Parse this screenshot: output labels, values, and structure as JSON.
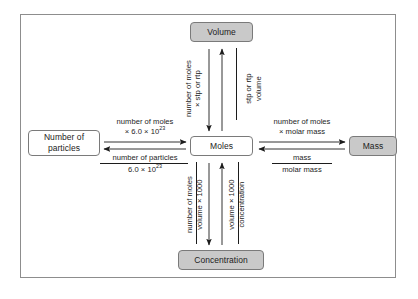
{
  "diagram": {
    "colors": {
      "box_grey": "#c9c9c9",
      "box_white": "#ffffff",
      "border": "#7a7a7a",
      "frame": "#8d8d8d",
      "text": "#1c1c1c",
      "arrow": "#1c1c1c"
    },
    "nodes": [
      {
        "id": "volume",
        "label": "Volume",
        "fill": "grey"
      },
      {
        "id": "moles",
        "label": "Moles",
        "fill": "white"
      },
      {
        "id": "concentration",
        "label": "Concentration",
        "fill": "grey"
      },
      {
        "id": "particles",
        "label": "Number of\nparticles",
        "label_line1": "Number of",
        "label_line2": "particles",
        "fill": "white"
      },
      {
        "id": "mass",
        "label": "Mass",
        "fill": "grey"
      }
    ],
    "edges": {
      "moles_to_volume": {
        "from": "Moles",
        "to": "Volume",
        "direction": "down",
        "operation_line1": "number of moles",
        "operation_line2": "× stp or rtp"
      },
      "volume_to_moles": {
        "from": "Volume",
        "to": "Moles",
        "direction": "up",
        "numerator": "volume",
        "denominator": "stp or rtp"
      },
      "particles_to_moles": {
        "from": "Number of particles",
        "to": "Moles",
        "direction": "right",
        "operation_line1": "number of moles",
        "operation_line2_prefix": "× 6.0 × 10",
        "operation_line2_exponent": "23"
      },
      "moles_to_particles": {
        "from": "Moles",
        "to": "Number of particles",
        "direction": "left",
        "numerator": "number of particles",
        "denominator_prefix": "6.0 × 10",
        "denominator_exponent": "23"
      },
      "moles_to_mass": {
        "from": "Moles",
        "to": "Mass",
        "direction": "right",
        "operation_line1": "number of moles",
        "operation_line2": "× molar mass"
      },
      "mass_to_moles": {
        "from": "Mass",
        "to": "Moles",
        "direction": "left",
        "numerator": "mass",
        "denominator": "molar mass"
      },
      "moles_to_concentration": {
        "from": "Moles",
        "to": "Concentration",
        "direction": "down",
        "numerator": "number of moles",
        "denominator": "volume × 1000"
      },
      "concentration_to_moles": {
        "from": "Concentration",
        "to": "Moles",
        "direction": "up",
        "numerator": "concentration",
        "denominator": "volume × 1000"
      }
    }
  }
}
